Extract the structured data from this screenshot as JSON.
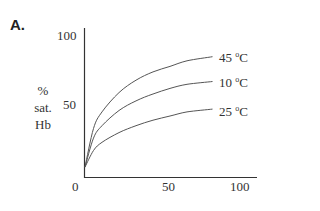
{
  "panel_label": "A.",
  "y_axis": {
    "label_lines": [
      "%",
      "sat.",
      "Hb"
    ],
    "ticks": [
      "100",
      "50"
    ]
  },
  "x_axis": {
    "ticks": [
      "0",
      "50",
      "100"
    ]
  },
  "series_labels": [
    {
      "temp": "45",
      "unit": "C",
      "degree": "o"
    },
    {
      "temp": "10",
      "unit": "C",
      "degree": "o"
    },
    {
      "temp": "25",
      "unit": "C",
      "degree": "o"
    }
  ],
  "chart_data": {
    "type": "line",
    "title": "A.",
    "xlabel": "",
    "ylabel": "% sat. Hb",
    "xlim": [
      0,
      100
    ],
    "ylim": [
      0,
      100
    ],
    "x_ticks": [
      0,
      50,
      100
    ],
    "y_ticks": [
      50,
      100
    ],
    "grid": false,
    "legend_position": "inline-right",
    "x": [
      0,
      5,
      10,
      20,
      30,
      40,
      50,
      60,
      75
    ],
    "series": [
      {
        "name": "45 °C",
        "values": [
          5,
          33,
          45,
          59,
          68,
          74,
          78,
          82,
          85
        ]
      },
      {
        "name": "10 °C",
        "values": [
          5,
          26,
          35,
          46,
          53,
          58,
          62,
          65,
          67
        ]
      },
      {
        "name": "25 °C",
        "values": [
          5,
          17,
          23,
          30,
          35,
          39,
          42,
          45,
          47
        ]
      }
    ]
  }
}
